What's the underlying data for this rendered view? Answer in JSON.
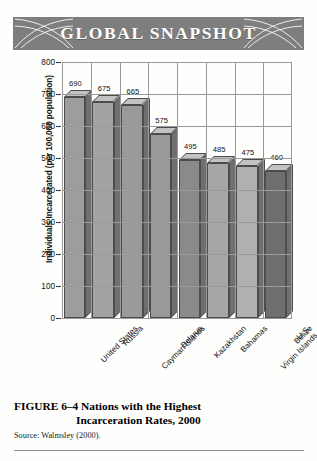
{
  "banner": {
    "title": "GLOBAL SNAPSHOT",
    "background_color": "#7e7e7e",
    "text_color": "#ffffff",
    "ornament_left": "swirl-arc-ornament",
    "ornament_right": "swirl-arc-ornament"
  },
  "caption": {
    "figure_number": "FIGURE 6–4",
    "line1": "Nations with the Highest",
    "line2": "Incarceration Rates, 2000",
    "source": "Source: Walmsley (2000)."
  },
  "chart_data": {
    "type": "bar",
    "title": "Nations with the Highest Incarceration Rates, 2000",
    "xlabel": "",
    "ylabel": "Individuals Incarcerated (per 100,000 population)",
    "categories": [
      "United States",
      "Russia",
      "Cayman Islands",
      "Belarus",
      "Kazakhstan",
      "Bahamas",
      "U.S. Virgin Islands",
      "Belize"
    ],
    "category_lines": [
      [
        "United States"
      ],
      [
        "Russia"
      ],
      [
        "Cayman Islands"
      ],
      [
        "Belarus"
      ],
      [
        "Kazakhstan"
      ],
      [
        "Bahamas"
      ],
      [
        "U.S.",
        "Virgin Islands"
      ],
      [
        "Belize"
      ]
    ],
    "values": [
      690,
      675,
      665,
      575,
      495,
      485,
      475,
      460
    ],
    "data_labels": [
      "690",
      "675",
      "665",
      "575",
      "495",
      "485",
      "475",
      "460"
    ],
    "ylim": [
      0,
      800
    ],
    "ytick_step": 100,
    "yticks": [
      0,
      100,
      200,
      300,
      400,
      500,
      600,
      700,
      800
    ],
    "ytick_labels": [
      "0",
      "100",
      "200",
      "300",
      "400",
      "500",
      "600",
      "700",
      "800"
    ],
    "grid": true,
    "grid_horizontal": true,
    "grid_vertical": true,
    "legend": false,
    "three_d": true,
    "bar_face_color": "#9d9d9d",
    "bar_top_color": "#c3c3c3",
    "bar_side_color": "#6f6f6f",
    "bar_shades": [
      "#9d9d9d",
      "#a3a3a3",
      "#9a9a9a",
      "#999999",
      "#8a8a8a",
      "#a6a6a6",
      "#b0b0b0",
      "#6e6e6e"
    ]
  }
}
